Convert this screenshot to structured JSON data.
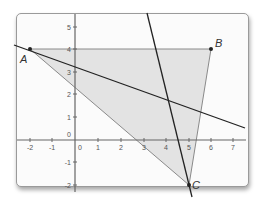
{
  "diagram": {
    "type": "coordinate-plane",
    "x_axis": {
      "min": -2,
      "max": 7,
      "ticks": [
        "-2",
        "-1",
        "0",
        "1",
        "2",
        "3",
        "4",
        "5",
        "6",
        "7"
      ]
    },
    "y_axis": {
      "min": -2,
      "max": 5,
      "ticks": [
        "-2",
        "-1",
        "0",
        "1",
        "2",
        "3",
        "4",
        "5"
      ]
    },
    "origin_label": "0",
    "points": [
      {
        "label": "A",
        "x": -2,
        "y": 4
      },
      {
        "label": "B",
        "x": 6,
        "y": 4
      },
      {
        "label": "C",
        "x": 5,
        "y": -2
      }
    ],
    "triangle": {
      "vertices": [
        "A",
        "B",
        "C"
      ],
      "fill": "#e3e3e3",
      "stroke": "#8a8a8a"
    },
    "lines": [
      {
        "name": "line-through-A",
        "color": "#222222",
        "description": "dark line through A descending to the right"
      },
      {
        "name": "line-through-C",
        "color": "#222222",
        "description": "steep dark line through C"
      }
    ],
    "colors": {
      "axis": "#666666",
      "frame_border": "#9a9a9a",
      "background": "#fbfbfb"
    }
  }
}
